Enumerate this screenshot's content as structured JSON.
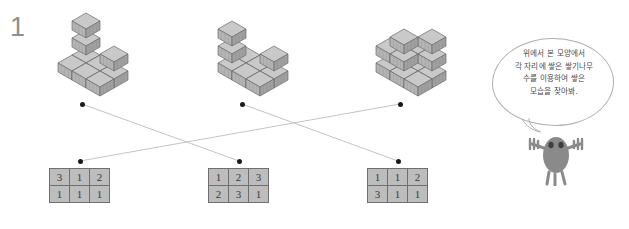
{
  "page": {
    "question_number": "1",
    "background": "#ffffff"
  },
  "speech_bubble": {
    "line1": "위에서 본 모양에서",
    "line2": "각 자리에 쌓은 쌓기나무",
    "line3": "수를 이용하여 쌓은",
    "line4": "모습을 찾아봐.",
    "full_text": "위에서 본 모양에서 각 자리에 쌓은 쌓기나무 수를 이용하여 쌓은 모습을 찾아봐."
  },
  "colors": {
    "cube_top": "#c9c9c9",
    "cube_left": "#b4b4b4",
    "cube_right": "#a0a0a0",
    "cube_stroke": "#6b6b6b",
    "grid_fill": "#bdbdbd",
    "grid_stroke": "#6f6f6f",
    "dot": "#1a1a1a",
    "line": "#c4c4c4",
    "character": "#8a8a8a"
  },
  "shapes": [
    {
      "id": "shape-a",
      "label": "stacked-cubes-shape-a",
      "dot": {
        "x": 82,
        "y": 104
      },
      "heights": [
        [
          3,
          1,
          2
        ],
        [
          1,
          1,
          1
        ]
      ]
    },
    {
      "id": "shape-b",
      "label": "stacked-cubes-shape-b",
      "dot": {
        "x": 242,
        "y": 104
      },
      "heights": [
        [
          1,
          1,
          2
        ],
        [
          3,
          1,
          1
        ]
      ]
    },
    {
      "id": "shape-c",
      "label": "stacked-cubes-shape-c",
      "dot": {
        "x": 400,
        "y": 104
      },
      "heights": [
        [
          1,
          2,
          3
        ],
        [
          2,
          3,
          1
        ]
      ]
    }
  ],
  "tables": [
    {
      "id": "table-1",
      "label": "top-view-number-grid-1",
      "dot": {
        "x": 80,
        "y": 161
      },
      "rows": [
        [
          "3",
          "1",
          "2"
        ],
        [
          "1",
          "1",
          "1"
        ]
      ]
    },
    {
      "id": "table-2",
      "label": "top-view-number-grid-2",
      "dot": {
        "x": 239,
        "y": 161
      },
      "rows": [
        [
          "1",
          "2",
          "3"
        ],
        [
          "2",
          "3",
          "1"
        ]
      ]
    },
    {
      "id": "table-3",
      "label": "top-view-number-grid-3",
      "dot": {
        "x": 398,
        "y": 161
      },
      "rows": [
        [
          "1",
          "1",
          "2"
        ],
        [
          "3",
          "1",
          "1"
        ]
      ]
    }
  ],
  "connections": [
    {
      "id": "conn-a-to-2",
      "from": "shape-a",
      "to": "table-2",
      "x1": 82,
      "y1": 104,
      "x2": 239,
      "y2": 161
    },
    {
      "id": "conn-b-to-3",
      "from": "shape-b",
      "to": "table-3",
      "x1": 242,
      "y1": 104,
      "x2": 398,
      "y2": 161
    },
    {
      "id": "conn-c-to-1",
      "from": "shape-c",
      "to": "table-1",
      "x1": 400,
      "y1": 104,
      "x2": 80,
      "y2": 161
    }
  ]
}
